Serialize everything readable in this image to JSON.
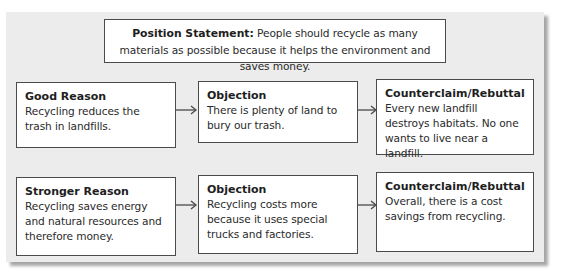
{
  "position_statement": {
    "label": "Position Statement:",
    "text": " People should recycle as many materials as possible because it helps the environment and saves money."
  },
  "rows": [
    {
      "reason": {
        "title": "Good Reason",
        "text": "Recycling reduces the trash in landfills."
      },
      "objection": {
        "title": "Objection",
        "text": "There is plenty of land to bury our trash."
      },
      "rebuttal": {
        "title": "Counterclaim/Rebuttal",
        "text": "Every new landfill destroys habitats. No one wants to live near a landfill."
      }
    },
    {
      "reason": {
        "title": "Stronger Reason",
        "text": "Recycling saves energy and natural resources and therefore money."
      },
      "objection": {
        "title": "Objection",
        "text": "Recycling costs more because it uses special trucks and factories."
      },
      "rebuttal": {
        "title": "Counterclaim/Rebuttal",
        "text": "Overall, there is a cost savings from recycling."
      }
    }
  ],
  "icons": {
    "arrow": "arrow-right-icon"
  },
  "colors": {
    "panel_background": "#ececec",
    "box_background": "#ffffff",
    "border": "#4a4a4a",
    "text": "#2a2a2a"
  }
}
